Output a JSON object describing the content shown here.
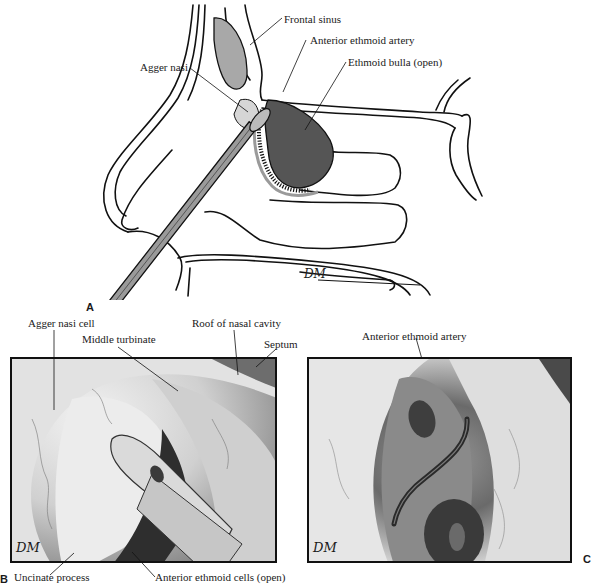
{
  "figure": {
    "panel_a": {
      "letter": "A",
      "labels": {
        "frontal_sinus": "Frontal sinus",
        "anterior_ethmoid_artery": "Anterior ethmoid artery",
        "ethmoid_bulla": "Ethmoid bulla (open)",
        "agger_nasi": "Agger nasi"
      },
      "signature": "DM"
    },
    "panel_b": {
      "letter": "B",
      "labels": {
        "agger_nasi_cell": "Agger nasi cell",
        "middle_turbinate": "Middle turbinate",
        "roof_of_nasal_cavity": "Roof of nasal cavity",
        "septum": "Septum",
        "uncinate_process": "Uncinate process",
        "anterior_ethmoid_cells": "Anterior ethmoid cells (open)"
      },
      "signature": "DM"
    },
    "panel_c": {
      "letter": "C",
      "labels": {
        "anterior_ethmoid_artery": "Anterior ethmoid artery"
      },
      "signature": "DM"
    },
    "colors": {
      "line": "#111111",
      "sinus_fill": "#a8a8a8",
      "bulla_fill": "#555555",
      "instrument_fill": "#9a9a9a",
      "background": "#ffffff"
    }
  }
}
